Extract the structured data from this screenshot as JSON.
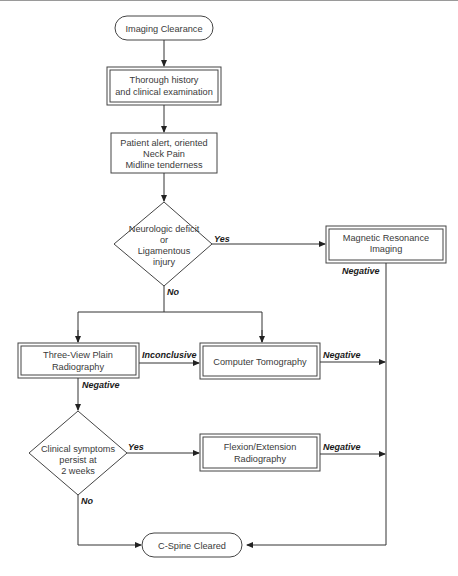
{
  "nodes": {
    "start": {
      "label": "Imaging Clearance"
    },
    "history": {
      "lines": [
        "Thorough history",
        "and clinical examination"
      ]
    },
    "criteria": {
      "lines": [
        "Patient alert, oriented",
        "Neck Pain",
        "Midline tenderness"
      ]
    },
    "decision1": {
      "lines": [
        "Neurologic deficit",
        "or",
        "Ligamentous",
        "injury"
      ]
    },
    "mri": {
      "lines": [
        "Magnetic Resonance",
        "Imaging"
      ]
    },
    "xray": {
      "lines": [
        "Three-View Plain",
        "Radiography"
      ]
    },
    "ct": {
      "label": "Computer Tomography"
    },
    "decision2": {
      "lines": [
        "Clinical symptoms",
        "persist at",
        "2 weeks"
      ]
    },
    "flexion": {
      "lines": [
        "Flexion/Extension",
        "Radiography"
      ]
    },
    "end": {
      "label": "C-Spine Cleared"
    }
  },
  "edge_labels": {
    "d1_yes": "Yes",
    "d1_no": "No",
    "mri_negative": "Negative",
    "xray_inconclusive": "Inconclusive",
    "xray_negative": "Negative",
    "ct_negative": "Negative",
    "d2_yes": "Yes",
    "d2_no": "No",
    "flexion_negative": "Negative"
  }
}
